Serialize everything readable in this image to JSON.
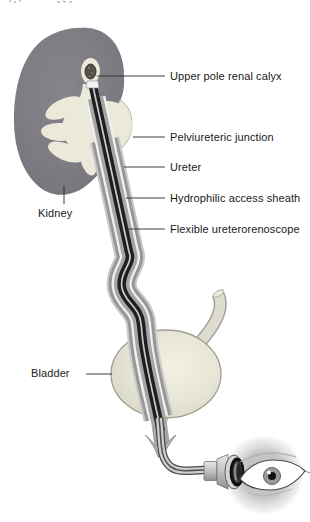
{
  "figure": {
    "type": "medical-illustration",
    "labels": {
      "upper_pole_renal_calyx": "Upper pole renal calyx",
      "pelviureteric_junction": "Pelviureteric junction",
      "ureter": "Ureter",
      "hydrophilic_access_sheath": "Hydrophilic access sheath",
      "flexible_ureterorenoscope": "Flexible ureterorenoscope",
      "kidney": "Kidney",
      "bladder": "Bladder"
    },
    "colors": {
      "background": "#ffffff",
      "kidney_parenchyma": "#8d8a90",
      "collecting_system": "#ebe9da",
      "bladder_fill": "#e9e7d7",
      "stone": "#56504b",
      "scope_core": "#1f1f1f",
      "access_sheath": "#a6a6a6",
      "ureter_wall": "#979797",
      "label_text": "#1a1a1a"
    }
  }
}
